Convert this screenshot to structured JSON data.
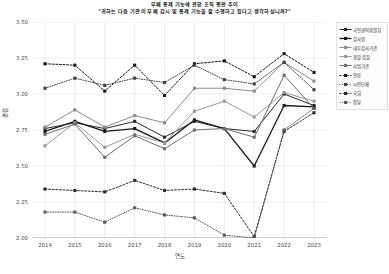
{
  "header": {
    "title": "부패 통제 기능에 관한 조직 평판 추이",
    "subtitle": "\"귀하는 다음 기관이 부패 감시 및 통제 기능을 잘 수행하고 있다고 생각하십니까?\""
  },
  "chart_data": {
    "type": "line",
    "title": "부패 통제 기능에 관한 조직 평판 추이",
    "subtitle": "\"귀하는 다음 기관이 부패 감시 및 통제 기능을 잘 수행하고 있다고 생각하십니까?\"",
    "xlabel": "연도",
    "ylabel": "평점",
    "x": [
      2014,
      2015,
      2016,
      2017,
      2018,
      2019,
      2020,
      2021,
      2022,
      2023
    ],
    "categories": [
      "2014",
      "2015",
      "2016",
      "2017",
      "2018",
      "2019",
      "2020",
      "2021",
      "2022",
      "2023"
    ],
    "ylim": [
      2.0,
      3.5
    ],
    "yticks": [
      2.0,
      2.25,
      2.5,
      2.75,
      3.0,
      3.25,
      3.5
    ],
    "ytick_labels": [
      "2.00",
      "2.25",
      "2.50",
      "2.75",
      "3.00",
      "3.25",
      "3.50"
    ],
    "grid": true,
    "legend_position": "right",
    "series": [
      {
        "name": "국민권익위원회",
        "values": [
          2.76,
          2.8,
          2.76,
          2.81,
          2.7,
          2.81,
          2.76,
          2.74,
          3.0,
          2.92
        ],
        "color": "#2b2b2b",
        "dash": "none",
        "width": 1.0,
        "marker": "square"
      },
      {
        "name": "감사원",
        "values": [
          2.74,
          2.81,
          2.74,
          2.76,
          2.66,
          2.82,
          2.76,
          2.5,
          2.92,
          2.91
        ],
        "color": "#1a1a1a",
        "dash": "none",
        "width": 1.3,
        "marker": "square"
      },
      {
        "name": "내부감사기관",
        "values": [
          2.77,
          2.89,
          2.77,
          2.85,
          2.8,
          3.04,
          3.04,
          3.02,
          3.22,
          3.09
        ],
        "color": "#8c8c8c",
        "dash": "none",
        "width": 1.0,
        "marker": "square"
      },
      {
        "name": "경찰·검찰",
        "values": [
          2.64,
          2.8,
          2.63,
          2.72,
          2.66,
          2.88,
          2.95,
          2.84,
          3.01,
          2.95
        ],
        "color": "#9a9a9a",
        "dash": "none",
        "width": 1.0,
        "marker": "square"
      },
      {
        "name": "사법기관",
        "values": [
          2.72,
          2.79,
          2.56,
          2.71,
          2.62,
          2.75,
          2.76,
          2.7,
          3.13,
          2.9
        ],
        "color": "#6f6f6f",
        "dash": "none",
        "width": 1.0,
        "marker": "square"
      },
      {
        "name": "언론",
        "values": [
          3.21,
          3.2,
          3.02,
          3.2,
          2.99,
          3.21,
          3.23,
          3.12,
          3.28,
          3.15
        ],
        "color": "#171717",
        "dash": "2 1.6",
        "width": 1.0,
        "marker": "square"
      },
      {
        "name": "시민단체",
        "values": [
          3.04,
          3.11,
          3.06,
          3.11,
          3.08,
          3.2,
          3.1,
          3.07,
          3.22,
          3.03
        ],
        "color": "#3f3f3f",
        "dash": "1 1.5",
        "width": 1.0,
        "marker": "square"
      },
      {
        "name": "국회",
        "values": [
          2.34,
          2.33,
          2.32,
          2.4,
          2.33,
          2.34,
          2.31,
          2.01,
          2.74,
          2.87
        ],
        "color": "#2e2e2e",
        "dash": "2 1.6",
        "width": 1.0,
        "marker": "square"
      },
      {
        "name": "정당",
        "values": [
          2.18,
          2.18,
          2.11,
          2.21,
          2.16,
          2.14,
          2.02,
          2.0,
          2.75,
          2.9
        ],
        "color": "#5a5a5a",
        "dash": "1 1.5",
        "width": 1.0,
        "marker": "square"
      }
    ]
  },
  "legend": {
    "items": [
      {
        "label": "국민권익위원회"
      },
      {
        "label": "감사원"
      },
      {
        "label": "내부감사기관"
      },
      {
        "label": "경찰·검찰"
      },
      {
        "label": "사법기관"
      },
      {
        "label": "언론"
      },
      {
        "label": "시민단체"
      },
      {
        "label": "국회"
      },
      {
        "label": "정당"
      }
    ]
  }
}
